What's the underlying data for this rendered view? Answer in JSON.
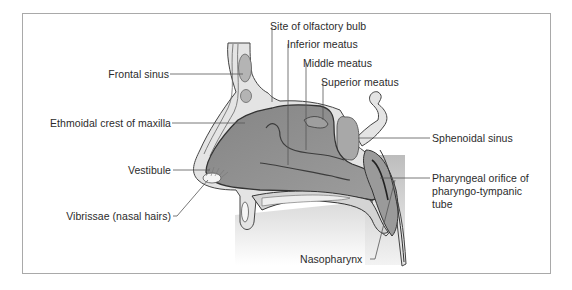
{
  "figure": {
    "colors": {
      "frame": "#a9a9a9",
      "cavity_dark": "#8a8a8a",
      "cavity_mid": "#a3a3a3",
      "tissue_light": "#d6d6d6",
      "bone_pale": "#e6e6e6",
      "outline": "#3a3a3a",
      "leader": "#555555",
      "text": "#2b2b2b"
    },
    "labels": {
      "olfactory_bulb": "Site of olfactory bulb",
      "inferior_meatus": "Inferior meatus",
      "middle_meatus": "Middle meatus",
      "superior_meatus": "Superior meatus",
      "frontal_sinus": "Frontal sinus",
      "ethmoidal_crest": "Ethmoidal crest of maxilla",
      "sphenoidal_sinus": "Sphenoidal sinus",
      "vestibule": "Vestibule",
      "vibrissae": "Vibrissae (nasal hairs)",
      "pharyngeal_orifice": "Pharyngeal orifice of pharyngo-tympanic tube",
      "nasopharynx": "Nasopharynx"
    }
  }
}
